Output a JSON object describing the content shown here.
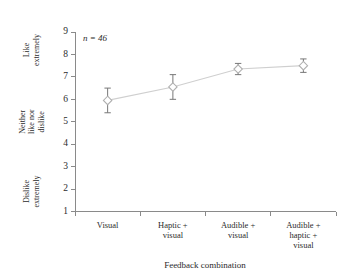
{
  "chart_data": {
    "type": "line",
    "title": "",
    "subtitle": "",
    "xlabel": "Feedback combination",
    "ylabel": "",
    "categories": [
      "Visual",
      "Haptic +\nvisual",
      "Audible +\nvisual",
      "Audible +\nhaptic +\nvisual"
    ],
    "category_lines": [
      [
        "Visual"
      ],
      [
        "Haptic +",
        "visual"
      ],
      [
        "Audible +",
        "visual"
      ],
      [
        "Audible +",
        "haptic +",
        "visual"
      ]
    ],
    "values": [
      5.95,
      6.55,
      7.35,
      7.5
    ],
    "error_lower": [
      0.55,
      0.55,
      0.25,
      0.3
    ],
    "error_upper": [
      0.55,
      0.55,
      0.25,
      0.3
    ],
    "ylim": [
      1,
      9
    ],
    "yticks": [
      1,
      2,
      3,
      4,
      5,
      6,
      7,
      8,
      9
    ],
    "ytick_labels": [
      "1",
      "2",
      "3",
      "4",
      "5",
      "6",
      "7",
      "8",
      "9"
    ],
    "y_category_labels": [
      {
        "lines": [
          "Like",
          "extremely"
        ],
        "value": 9
      },
      {
        "lines": [
          "Neither",
          "like nor",
          "dislike"
        ],
        "value": 5
      },
      {
        "lines": [
          "Dislike",
          "extremely"
        ],
        "value": 1
      }
    ],
    "annotations": [
      {
        "text": "n = 46",
        "x_value": 0,
        "y_value": 8.6
      }
    ],
    "grid": false,
    "legend": "none",
    "marker": "open-diamond",
    "colors": {
      "line": "#cfcfcf",
      "marker_fill": "#ffffff",
      "marker_stroke": "#b0b0b0",
      "error_bar": "#777777",
      "axis": "#8a8a8a",
      "text": "#2b2b2b",
      "background": "#ffffff"
    }
  },
  "annotation_text": {
    "sample_size": "n = 46"
  }
}
